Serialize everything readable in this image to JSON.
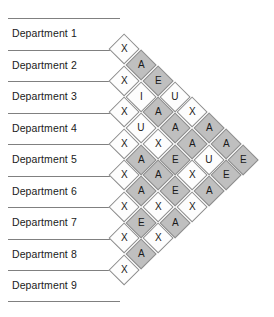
{
  "chart": {
    "type": "rel-chart",
    "department_count": 9
  },
  "departments": [
    {
      "label": "Department 1"
    },
    {
      "label": "Department 2"
    },
    {
      "label": "Department 3"
    },
    {
      "label": "Department 4"
    },
    {
      "label": "Department 5"
    },
    {
      "label": "Department 6"
    },
    {
      "label": "Department 7"
    },
    {
      "label": "Department 8"
    },
    {
      "label": "Department 9"
    }
  ],
  "colors": {
    "shade_gray": "#bfbfbf",
    "shade_white": "#fdfdfd",
    "cell_border": "#8d8d8d",
    "rule": "#808080",
    "text": "#1a1a1a"
  },
  "chart_data": {
    "type": "table",
    "categories": [
      "Department 1",
      "Department 2",
      "Department 3",
      "Department 4",
      "Department 5",
      "Department 6",
      "Department 7",
      "Department 8",
      "Department 9"
    ],
    "rating_codes": [
      "A",
      "E",
      "I",
      "O",
      "U",
      "X"
    ],
    "diagonals": [
      {
        "offset": 1,
        "values": [
          "X",
          "X",
          "X",
          "X",
          "X",
          "X",
          "X",
          "X"
        ]
      },
      {
        "offset": 2,
        "values": [
          "A",
          "I",
          "U",
          "A",
          "A",
          "E",
          "A"
        ]
      },
      {
        "offset": 3,
        "values": [
          "E",
          "A",
          "X",
          "A",
          "X",
          "X"
        ]
      },
      {
        "offset": 4,
        "values": [
          "U",
          "A",
          "E",
          "E",
          "A"
        ]
      },
      {
        "offset": 5,
        "values": [
          "X",
          "A",
          "X",
          "X"
        ]
      },
      {
        "offset": 6,
        "values": [
          "A",
          "U",
          "A"
        ]
      },
      {
        "offset": 7,
        "values": [
          "A",
          "E"
        ]
      },
      {
        "offset": 8,
        "values": [
          "E"
        ]
      }
    ],
    "pairs": [
      {
        "a": 1,
        "b": 2,
        "rating": "X"
      },
      {
        "a": 1,
        "b": 3,
        "rating": "A"
      },
      {
        "a": 1,
        "b": 4,
        "rating": "E"
      },
      {
        "a": 1,
        "b": 5,
        "rating": "U"
      },
      {
        "a": 1,
        "b": 6,
        "rating": "X"
      },
      {
        "a": 1,
        "b": 7,
        "rating": "A"
      },
      {
        "a": 1,
        "b": 8,
        "rating": "A"
      },
      {
        "a": 1,
        "b": 9,
        "rating": "E"
      },
      {
        "a": 2,
        "b": 3,
        "rating": "X"
      },
      {
        "a": 2,
        "b": 4,
        "rating": "I"
      },
      {
        "a": 2,
        "b": 5,
        "rating": "A"
      },
      {
        "a": 2,
        "b": 6,
        "rating": "A"
      },
      {
        "a": 2,
        "b": 7,
        "rating": "A"
      },
      {
        "a": 2,
        "b": 8,
        "rating": "U"
      },
      {
        "a": 2,
        "b": 9,
        "rating": "E"
      },
      {
        "a": 3,
        "b": 4,
        "rating": "X"
      },
      {
        "a": 3,
        "b": 5,
        "rating": "U"
      },
      {
        "a": 3,
        "b": 6,
        "rating": "X"
      },
      {
        "a": 3,
        "b": 7,
        "rating": "E"
      },
      {
        "a": 3,
        "b": 8,
        "rating": "X"
      },
      {
        "a": 3,
        "b": 9,
        "rating": "A"
      },
      {
        "a": 4,
        "b": 5,
        "rating": "X"
      },
      {
        "a": 4,
        "b": 6,
        "rating": "A"
      },
      {
        "a": 4,
        "b": 7,
        "rating": "A"
      },
      {
        "a": 4,
        "b": 8,
        "rating": "A"
      },
      {
        "a": 4,
        "b": 9,
        "rating": "X"
      },
      {
        "a": 5,
        "b": 6,
        "rating": "X"
      },
      {
        "a": 5,
        "b": 7,
        "rating": "A"
      },
      {
        "a": 5,
        "b": 8,
        "rating": "E"
      },
      {
        "a": 5,
        "b": 9,
        "rating": "X"
      },
      {
        "a": 6,
        "b": 7,
        "rating": "X"
      },
      {
        "a": 6,
        "b": 8,
        "rating": "A"
      },
      {
        "a": 6,
        "b": 9,
        "rating": "E"
      },
      {
        "a": 7,
        "b": 8,
        "rating": "X"
      },
      {
        "a": 7,
        "b": 9,
        "rating": "U"
      },
      {
        "a": 8,
        "b": 9,
        "rating": "X"
      }
    ],
    "shading": {
      "A": "gray",
      "E": "gray",
      "I": "white",
      "O": "white",
      "U": "white",
      "X": "white"
    },
    "shading_overrides": [
      {
        "offset": 2,
        "index": 5,
        "shade": "gray"
      },
      {
        "offset": 3,
        "index": 2,
        "shade": "white"
      },
      {
        "offset": 3,
        "index": 4,
        "shade": "white"
      },
      {
        "offset": 3,
        "index": 5,
        "shade": "white"
      },
      {
        "offset": 4,
        "index": 0,
        "shade": "white"
      },
      {
        "offset": 5,
        "index": 0,
        "shade": "white"
      },
      {
        "offset": 5,
        "index": 2,
        "shade": "white"
      },
      {
        "offset": 5,
        "index": 3,
        "shade": "white"
      },
      {
        "offset": 6,
        "index": 1,
        "shade": "white"
      }
    ]
  }
}
